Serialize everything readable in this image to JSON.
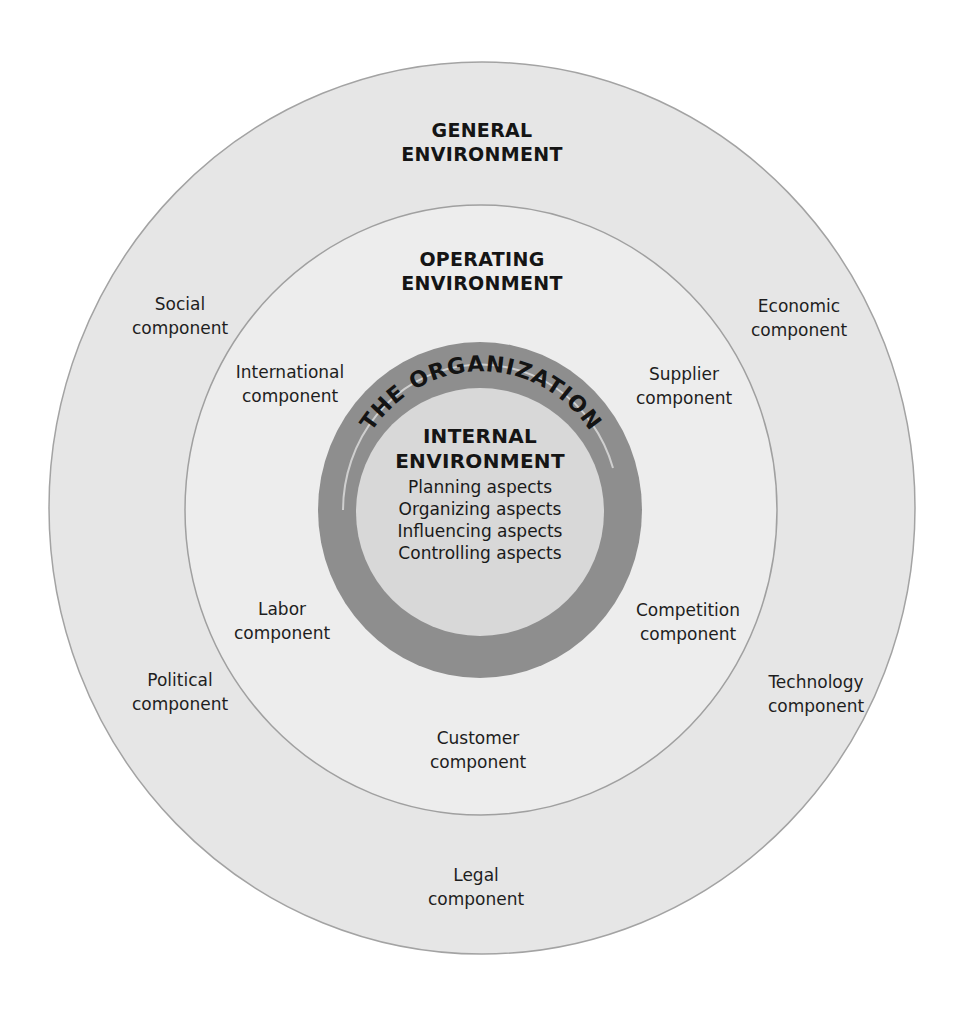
{
  "diagram": {
    "type": "nested-circles",
    "colors": {
      "general_fill": "#e6e6e6",
      "general_stroke": "#9a9a9a",
      "operating_fill": "#ececec",
      "operating_stroke": "#a0a0a0",
      "organization_ring": "#8c8c8c",
      "internal_fill": "#d6d6d6",
      "text": "#1a1a1a"
    },
    "general": {
      "title_line1": "GENERAL",
      "title_line2": "ENVIRONMENT",
      "components": {
        "social": [
          "Social",
          "component"
        ],
        "economic": [
          "Economic",
          "component"
        ],
        "political": [
          "Political",
          "component"
        ],
        "technology": [
          "Technology",
          "component"
        ],
        "legal": [
          "Legal",
          "component"
        ]
      }
    },
    "operating": {
      "title_line1": "OPERATING",
      "title_line2": "ENVIRONMENT",
      "components": {
        "international": [
          "International",
          "component"
        ],
        "supplier": [
          "Supplier",
          "component"
        ],
        "labor": [
          "Labor",
          "component"
        ],
        "competition": [
          "Competition",
          "component"
        ],
        "customer": [
          "Customer",
          "component"
        ]
      }
    },
    "organization": {
      "ring_label": "THE ORGANIZATION"
    },
    "internal": {
      "title_line1": "INTERNAL",
      "title_line2": "ENVIRONMENT",
      "aspects": [
        "Planning aspects",
        "Organizing aspects",
        "Influencing aspects",
        "Controlling aspects"
      ]
    }
  }
}
